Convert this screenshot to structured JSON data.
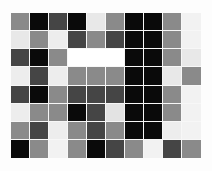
{
  "figure": {
    "background_color": "#fdfdfd",
    "grid_background": "#ffffff",
    "gridline_color": "#f7f7f7"
  },
  "palette": {
    "black": "#0a0a0a",
    "dark_gray": "#454545",
    "medium_gray": "#8a8a8a",
    "light_gray": "#c9c9c9",
    "light": "#e3e3e3",
    "very_light": "#f2f2f2",
    "white": "#ffffff"
  },
  "chart_data": {
    "type": "heatmap",
    "title": "",
    "xlabel": "",
    "ylabel": "",
    "grid": true,
    "legend_position": "none",
    "rows": 8,
    "columns": 10,
    "colorscale": "grayscale",
    "value_range": [
      0,
      255
    ],
    "colors": [
      [
        "#8a8a8a",
        "#0a0a0a",
        "#454545",
        "#0a0a0a",
        "#e8e8e8",
        "#8a8a8a",
        "#0a0a0a",
        "#0a0a0a",
        "#8a8a8a",
        "#f2f2f2"
      ],
      [
        "#e8e8e8",
        "#8a8a8a",
        "#ededed",
        "#454545",
        "#8a8a8a",
        "#454545",
        "#0a0a0a",
        "#0a0a0a",
        "#8a8a8a",
        "#f2f2f2"
      ],
      [
        "#454545",
        "#0a0a0a",
        "#8a8a8a",
        "#ffffff",
        "#ffffff",
        "#ffffff",
        "#0a0a0a",
        "#0a0a0a",
        "#8a8a8a",
        "#e8e8e8"
      ],
      [
        "#ededed",
        "#454545",
        "#ededed",
        "#8a8a8a",
        "#8a8a8a",
        "#8a8a8a",
        "#0a0a0a",
        "#0a0a0a",
        "#e8e8e8",
        "#8a8a8a"
      ],
      [
        "#454545",
        "#0a0a0a",
        "#8a8a8a",
        "#454545",
        "#454545",
        "#454545",
        "#0a0a0a",
        "#0a0a0a",
        "#8a8a8a",
        "#f2f2f2"
      ],
      [
        "#ededed",
        "#8a8a8a",
        "#8a8a8a",
        "#0a0a0a",
        "#454545",
        "#e3e3e3",
        "#0a0a0a",
        "#0a0a0a",
        "#8a8a8a",
        "#f2f2f2"
      ],
      [
        "#8a8a8a",
        "#454545",
        "#ededed",
        "#8a8a8a",
        "#454545",
        "#8a8a8a",
        "#0a0a0a",
        "#0a0a0a",
        "#ededed",
        "#f2f2f2"
      ],
      [
        "#0a0a0a",
        "#8a8a8a",
        "#f2f2f2",
        "#8a8a8a",
        "#0a0a0a",
        "#454545",
        "#8a8a8a",
        "#f2f2f2",
        "#454545",
        "#8a8a8a"
      ]
    ],
    "values": [
      [
        138,
        10,
        69,
        10,
        232,
        138,
        10,
        10,
        138,
        242
      ],
      [
        232,
        138,
        237,
        69,
        138,
        69,
        10,
        10,
        138,
        242
      ],
      [
        69,
        10,
        138,
        255,
        255,
        255,
        10,
        10,
        138,
        232
      ],
      [
        237,
        69,
        237,
        138,
        138,
        138,
        10,
        10,
        232,
        138
      ],
      [
        69,
        10,
        138,
        69,
        69,
        69,
        10,
        10,
        138,
        242
      ],
      [
        237,
        138,
        138,
        10,
        69,
        227,
        10,
        10,
        138,
        242
      ],
      [
        138,
        69,
        237,
        138,
        69,
        138,
        10,
        10,
        237,
        242
      ],
      [
        10,
        138,
        242,
        138,
        10,
        69,
        138,
        242,
        69,
        138
      ]
    ],
    "merged_regions": [
      {
        "row": 2,
        "col_start": 3,
        "col_end": 5,
        "color": "#ffffff",
        "value": 255
      }
    ]
  }
}
